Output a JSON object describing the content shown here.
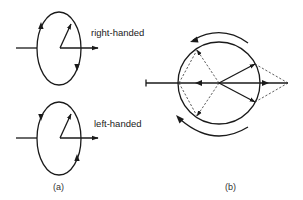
{
  "figure": {
    "panel_a": {
      "caption": "(a)",
      "diagrams": [
        {
          "label": "right-handed",
          "rotation": "clockwise-as-viewed"
        },
        {
          "label": "left-handed",
          "rotation": "counterclockwise-as-viewed"
        }
      ]
    },
    "panel_b": {
      "caption": "(b)",
      "description": "circle with horizontal axis, resultant vectors and counter-rotating arcs"
    }
  },
  "colors": {
    "stroke": "#1a1a1a",
    "background": "#ffffff"
  }
}
